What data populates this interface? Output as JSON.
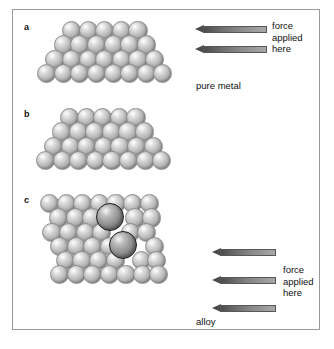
{
  "figure": {
    "background_color": "#ffffff",
    "frame_color": "#9a9a9a",
    "atom_color": "#c4c4c4",
    "alloy_atom_color": "#8c8c8c",
    "alloy_atom_outline": "#1d1d1d",
    "arrow_color": "#4b4b4b"
  },
  "panels": [
    {
      "id": "a",
      "label": "a",
      "caption": "pure metal",
      "arrow_label": "force\napplied\nhere",
      "arrow_lines": [
        "force",
        "applied",
        "here"
      ],
      "arrow_count": 2,
      "rows": [
        5,
        6,
        7,
        8
      ]
    },
    {
      "id": "b",
      "label": "b",
      "caption": "",
      "arrow_label": "",
      "arrow_lines": [],
      "arrow_count": 0,
      "rows": [
        5,
        6,
        7,
        8
      ]
    },
    {
      "id": "c",
      "label": "c",
      "caption": "alloy",
      "arrow_label": "force\napplied\nhere",
      "arrow_lines": [
        "force",
        "applied",
        "here"
      ],
      "arrow_count": 3,
      "rows": [
        7,
        6,
        6,
        6,
        6,
        6
      ],
      "large_atom_count": 2
    }
  ],
  "labels": {
    "force_line1": "force",
    "force_line2": "applied",
    "force_line3": "here",
    "pure_metal": "pure metal",
    "alloy": "alloy",
    "panel_a": "a",
    "panel_b": "b",
    "panel_c": "c"
  }
}
